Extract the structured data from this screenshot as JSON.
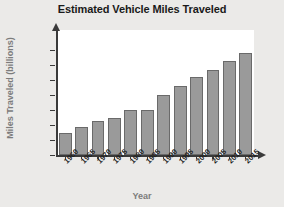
{
  "chart_data": {
    "type": "bar",
    "title": "Estimated Vehicle Miles Traveled",
    "xlabel": "Year",
    "ylabel": "Miles Traveled (billions)",
    "categories": [
      "1960",
      "1965",
      "1970",
      "1975",
      "1980",
      "1985",
      "1990",
      "1995",
      "2000",
      "2005",
      "2010",
      "2015"
    ],
    "values": [
      750,
      950,
      1150,
      1250,
      1500,
      1500,
      2000,
      2300,
      2600,
      2850,
      3150,
      3400
    ],
    "ylim": [
      0,
      3500
    ],
    "ytick_values": [
      0,
      500,
      1000,
      1500,
      2000,
      2500,
      3000,
      3500
    ],
    "ytick_labels": [
      "0",
      "500",
      "1,000",
      "1,500",
      "2,000",
      "2,500",
      "3,000",
      "3,500"
    ],
    "grid": false,
    "legend": "none",
    "bar_color": "#9a9a9a",
    "bar_border_color": "#6a6a6a",
    "axis_color": "#3a3a3a",
    "plot_background": "#ffffff",
    "page_background": "#ebeae8"
  }
}
